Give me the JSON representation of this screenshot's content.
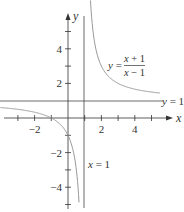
{
  "chart_data": {
    "type": "line",
    "title": "",
    "function_label": {
      "lhs": "y =",
      "numerator": "x + 1",
      "denominator": "x − 1"
    },
    "xlabel": "x",
    "ylabel": "y",
    "xlim": [
      -4,
      6
    ],
    "ylim": [
      -5.8,
      6.8
    ],
    "x_ticks": [
      -3,
      -2,
      -1,
      1,
      2,
      3,
      4,
      5
    ],
    "x_tick_labels": [
      "−2",
      "2",
      "4"
    ],
    "x_tick_label_values": [
      -2,
      2,
      4
    ],
    "y_ticks": [
      -5,
      -4,
      -3,
      -2,
      -1,
      1,
      2,
      3,
      4,
      5
    ],
    "y_tick_labels": [
      "4",
      "2",
      "−2",
      "−4"
    ],
    "y_tick_label_values": [
      4,
      2,
      -2,
      -4
    ],
    "grid": false,
    "asymptotes": [
      {
        "type": "vertical",
        "value": 1,
        "label": "x = 1"
      },
      {
        "type": "horizontal",
        "value": 1,
        "label": "y = 1"
      }
    ],
    "series": [
      {
        "name": "y = (x+1)/(x-1), x > 1",
        "x": [
          1.33,
          1.4,
          1.5,
          1.75,
          2,
          2.5,
          3,
          3.5,
          4,
          4.5,
          5,
          5.5
        ],
        "y": [
          7.0,
          6.0,
          5.0,
          3.67,
          3.0,
          2.33,
          2.0,
          1.8,
          1.67,
          1.57,
          1.5,
          1.44
        ]
      },
      {
        "name": "y = (x+1)/(x-1), x < 1",
        "x": [
          -4,
          -3.5,
          -3,
          -2.5,
          -2,
          -1.5,
          -1,
          -0.5,
          0,
          0.25,
          0.4,
          0.5,
          0.6,
          0.65
        ],
        "y": [
          0.6,
          0.56,
          0.5,
          0.43,
          0.33,
          0.2,
          0,
          -0.33,
          -1,
          -1.67,
          -2.33,
          -3,
          -4,
          -4.71
        ]
      }
    ],
    "colors": {
      "axes": "#333333",
      "curve": "#999999",
      "asymptote": "#444444"
    }
  }
}
